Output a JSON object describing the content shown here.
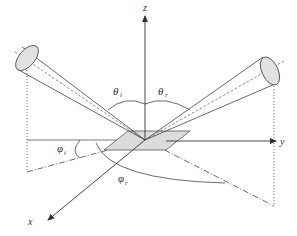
{
  "diagram": {
    "title": "",
    "axes": {
      "z_label": "z",
      "y_label": "y",
      "x_label": "x"
    },
    "angles": {
      "theta_i": {
        "symbol": "θ",
        "sub": "i"
      },
      "theta_r": {
        "symbol": "θ",
        "sub": "r"
      },
      "phi_i": {
        "symbol": "φ",
        "sub": "i"
      },
      "phi_r": {
        "symbol": "φ",
        "sub": "r"
      }
    },
    "colors": {
      "line": "#333333",
      "fill_surface": "#dcdcdc",
      "fill_ellipse": "#e2e2e2"
    }
  }
}
